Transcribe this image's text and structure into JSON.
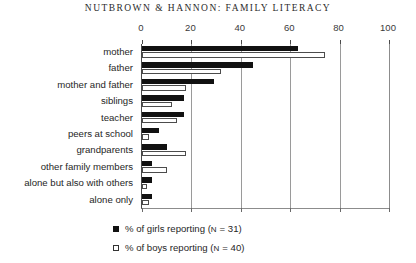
{
  "running_head": "NUTBROWN & HANNON: FAMILY LITERACY",
  "chart_data": {
    "type": "bar",
    "orientation": "horizontal",
    "title": "",
    "subtitle": "",
    "xlabel": "",
    "ylabel": "",
    "xlim": [
      0,
      100
    ],
    "ylim": null,
    "xticks": [
      0,
      20,
      40,
      60,
      80,
      100
    ],
    "xtick_labels": [
      "0",
      "20",
      "40",
      "60",
      "80",
      "100"
    ],
    "grid": true,
    "grid_axis": "x",
    "axis_position": "top",
    "legend_position": "bottom-center",
    "categories": [
      "mother",
      "father",
      "mother and father",
      "siblings",
      "teacher",
      "peers at school",
      "grandparents",
      "other family members",
      "alone but also with others",
      "alone only"
    ],
    "series": [
      {
        "name": "% of girls reporting (N = 31)",
        "key": "girls",
        "color": "#111111",
        "style": "filled",
        "values": [
          63,
          45,
          29,
          17,
          17,
          7,
          10,
          4,
          4,
          4
        ]
      },
      {
        "name": "% of boys reporting (N = 40)",
        "key": "boys",
        "color": "#ffffff",
        "style": "hollow",
        "values": [
          74,
          32,
          18,
          12,
          14,
          3,
          18,
          10,
          2,
          3
        ]
      }
    ]
  },
  "legend": {
    "items": [
      {
        "label": "% of girls reporting (N = 31)",
        "swatch": "filled"
      },
      {
        "label": "% of boys reporting (N = 40)",
        "swatch": "hollow"
      }
    ]
  }
}
